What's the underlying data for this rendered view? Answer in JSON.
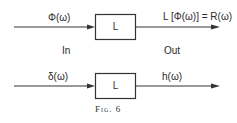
{
  "diagram": {
    "top_row": {
      "input_label": "Φ(ω)",
      "block_label": "L",
      "output_label": "L [Φ(ω)] = R(ω)",
      "in_label": "In",
      "out_label": "Out"
    },
    "bottom_row": {
      "input_label": "δ(ω)",
      "block_label": "L",
      "output_label": "h(ω)"
    },
    "caption": "Fig. 6",
    "colors": {
      "line": "#333333",
      "background": "#ffffff"
    }
  }
}
